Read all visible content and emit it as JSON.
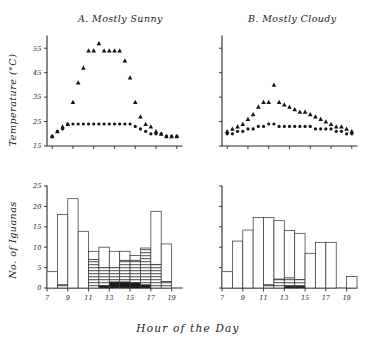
{
  "figure": {
    "xlabel": "Hour of the Day",
    "panels": {
      "a_title": "A. Mostly Sunny",
      "b_title": "B. Mostly Cloudy",
      "temp_ylabel": "Temperature (°C)",
      "count_ylabel": "No. of Iguanas"
    }
  },
  "chart_data": [
    {
      "type": "scatter",
      "title": "A. Mostly Sunny",
      "xlabel": "Hour of the Day",
      "ylabel": "Temperature (°C)",
      "xlim": [
        6.5,
        19.5
      ],
      "ylim": [
        15,
        60
      ],
      "yticks": [
        15,
        25,
        35,
        45,
        55
      ],
      "xticks": [
        7,
        9,
        11,
        13,
        15,
        17,
        19
      ],
      "grid": false,
      "legend": false,
      "x": [
        7,
        7.5,
        8,
        8.5,
        9,
        9.5,
        10,
        10.5,
        11,
        11.5,
        12,
        12.5,
        13,
        13.5,
        14,
        14.5,
        15,
        15.5,
        16,
        16.5,
        17,
        17.5,
        18,
        18.5,
        19
      ],
      "series": [
        {
          "name": "Substrate temperature",
          "marker": "triangle",
          "values": [
            19,
            21,
            23,
            24,
            33,
            41,
            47,
            54,
            54,
            57,
            54,
            54,
            54,
            54,
            50,
            43,
            33,
            27,
            24,
            23,
            21,
            20,
            19,
            19,
            19
          ]
        },
        {
          "name": "Body temperature",
          "marker": "circle",
          "values": [
            19,
            21,
            22,
            24,
            24,
            24,
            24,
            24,
            24,
            24,
            24,
            24,
            24,
            24,
            24,
            24,
            23,
            22,
            21,
            20,
            20,
            20,
            19,
            19,
            19
          ]
        }
      ]
    },
    {
      "type": "scatter",
      "title": "B. Mostly Cloudy",
      "xlabel": "Hour of the Day",
      "ylabel": "Temperature (°C)",
      "xlim": [
        6.5,
        19.5
      ],
      "ylim": [
        15,
        60
      ],
      "yticks": [
        15,
        25,
        35,
        45,
        55
      ],
      "xticks": [
        7,
        9,
        11,
        13,
        15,
        17,
        19
      ],
      "grid": false,
      "legend": false,
      "x": [
        7,
        7.5,
        8,
        8.5,
        9,
        9.5,
        10,
        10.5,
        11,
        11.5,
        12,
        12.5,
        13,
        13.5,
        14,
        14.5,
        15,
        15.5,
        16,
        16.5,
        17,
        17.5,
        18,
        18.5,
        19
      ],
      "series": [
        {
          "name": "Substrate temperature",
          "marker": "triangle",
          "values": [
            21,
            22,
            23,
            24,
            26,
            28,
            31,
            33,
            33,
            40,
            33,
            32,
            31,
            30,
            29,
            29,
            28,
            27,
            26,
            25,
            24,
            23,
            23,
            22,
            21
          ]
        },
        {
          "name": "Body temperature",
          "marker": "circle",
          "values": [
            20,
            20,
            21,
            21,
            22,
            22,
            23,
            23,
            24,
            24,
            23,
            23,
            23,
            23,
            23,
            23,
            23,
            22,
            22,
            22,
            22,
            21,
            21,
            20,
            20
          ]
        }
      ]
    },
    {
      "type": "bar",
      "title": "A. Mostly Sunny",
      "xlabel": "Hour of the Day",
      "ylabel": "No. of Iguanas",
      "stacked": true,
      "xlim": [
        7,
        20
      ],
      "ylim": [
        0,
        25
      ],
      "yticks": [
        0,
        5,
        10,
        15,
        20,
        25
      ],
      "xticks": [
        7,
        9,
        11,
        13,
        15,
        17,
        19
      ],
      "grid": false,
      "categories": [
        "7",
        "8",
        "9",
        "10",
        "11",
        "12",
        "13",
        "14",
        "15",
        "16",
        "17",
        "18",
        "19"
      ],
      "series": [
        {
          "name": "Black (in shade)",
          "fill": "black",
          "values": [
            0,
            0,
            0,
            0,
            0,
            0.6,
            1.5,
            1.5,
            1.3,
            0.8,
            0,
            0,
            0
          ]
        },
        {
          "name": "Hatched (partial sun)",
          "fill": "hatched",
          "values": [
            0,
            0.8,
            0,
            0,
            7,
            4.4,
            3.5,
            5.3,
            5.5,
            9,
            5.8,
            1.6,
            0
          ]
        },
        {
          "name": "Open (full sun)",
          "fill": "open",
          "values": [
            4,
            17.2,
            21.9,
            13.9,
            2,
            5,
            4,
            2.2,
            1.2,
            0,
            13,
            9.2,
            0
          ]
        }
      ],
      "totals": [
        4,
        18,
        21.9,
        13.9,
        9,
        10,
        9,
        9,
        8,
        9.8,
        18.8,
        10.8,
        0
      ]
    },
    {
      "type": "bar",
      "title": "B. Mostly Cloudy",
      "xlabel": "Hour of the Day",
      "ylabel": "No. of Iguanas",
      "stacked": true,
      "xlim": [
        7,
        20
      ],
      "ylim": [
        0,
        25
      ],
      "yticks": [
        0,
        5,
        10,
        15,
        20,
        25
      ],
      "xticks": [
        7,
        9,
        11,
        13,
        15,
        17,
        19
      ],
      "grid": false,
      "categories": [
        "7",
        "8",
        "9",
        "10",
        "11",
        "12",
        "13",
        "14",
        "15",
        "16",
        "17",
        "18",
        "19"
      ],
      "series": [
        {
          "name": "Black (in shade)",
          "fill": "black",
          "values": [
            0,
            0,
            0,
            0,
            0,
            0,
            0.5,
            0.5,
            0,
            0,
            0,
            0,
            0
          ]
        },
        {
          "name": "Hatched (partial sun)",
          "fill": "hatched",
          "values": [
            0,
            0,
            0,
            0,
            0.8,
            2.2,
            2.0,
            1.6,
            0,
            0,
            0,
            0,
            0
          ]
        },
        {
          "name": "Open (full sun)",
          "fill": "open",
          "values": [
            4,
            11.5,
            14.2,
            17.3,
            16.5,
            14.3,
            11.6,
            11.3,
            8.5,
            11.2,
            11.2,
            0,
            2.8
          ]
        }
      ],
      "totals": [
        4,
        11.5,
        14.2,
        17.3,
        17.3,
        16.5,
        14.1,
        13.4,
        8.5,
        11.2,
        11.2,
        0,
        2.8
      ]
    }
  ]
}
